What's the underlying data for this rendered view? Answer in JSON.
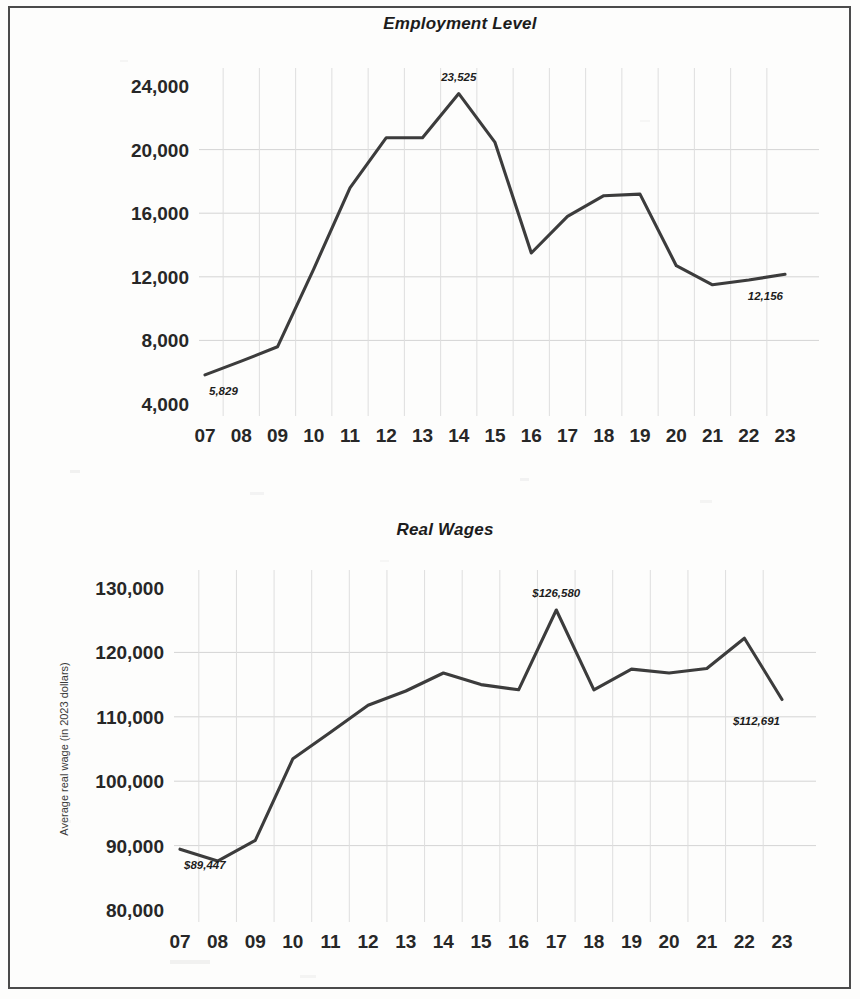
{
  "page": {
    "background_color": "#fdfdfc",
    "border_color": "#4b4b4b",
    "line_color": "#3c3c3c",
    "grid_color": "#d4d4d4"
  },
  "charts": {
    "employment": {
      "title": "Employment Level",
      "ylabel": "",
      "xlabel": "",
      "ylim": [
        4000,
        24000
      ],
      "ytick_step": 4000,
      "yticks": [
        "4,000",
        "8,000",
        "12,000",
        "16,000",
        "20,000",
        "24,000"
      ],
      "ytick_values": [
        4000,
        8000,
        12000,
        16000,
        20000,
        24000
      ],
      "xticks": [
        "07",
        "08",
        "09",
        "10",
        "11",
        "12",
        "13",
        "14",
        "15",
        "16",
        "17",
        "18",
        "19",
        "20",
        "21",
        "22",
        "23"
      ],
      "start_label": "5,829",
      "peak_label": "23,525",
      "end_label": "12,156"
    },
    "wages": {
      "title": "Real Wages",
      "ylabel": "Average real wage (in 2023 dollars)",
      "xlabel": "",
      "ylim": [
        80000,
        130000
      ],
      "ytick_step": 10000,
      "yticks": [
        "80,000",
        "90,000",
        "100,000",
        "110,000",
        "120,000",
        "130,000"
      ],
      "ytick_values": [
        80000,
        90000,
        100000,
        110000,
        120000,
        130000
      ],
      "xticks": [
        "07",
        "08",
        "09",
        "10",
        "11",
        "12",
        "13",
        "14",
        "15",
        "16",
        "17",
        "18",
        "19",
        "20",
        "21",
        "22",
        "23"
      ],
      "start_label": "$89,447",
      "peak_label": "$126,580",
      "end_label": "$112,691"
    }
  },
  "chart_data": [
    {
      "type": "line",
      "title": "Employment Level",
      "xlabel": "",
      "ylabel": "",
      "grid": true,
      "legend": "none",
      "ylim": [
        4000,
        24000
      ],
      "ytick_step": 4000,
      "x": [
        "07",
        "08",
        "09",
        "10",
        "11",
        "12",
        "13",
        "14",
        "15",
        "16",
        "17",
        "18",
        "19",
        "20",
        "21",
        "22",
        "23"
      ],
      "categories": [
        "07",
        "08",
        "09",
        "10",
        "11",
        "12",
        "13",
        "14",
        "15",
        "16",
        "17",
        "18",
        "19",
        "20",
        "21",
        "22",
        "23"
      ],
      "values": [
        5829,
        6700,
        7600,
        12500,
        17600,
        20750,
        20750,
        23525,
        20450,
        13500,
        15800,
        17100,
        17200,
        12700,
        11500,
        11800,
        12156
      ],
      "annotations": [
        {
          "x": "07",
          "text": "5,829",
          "value": 5829
        },
        {
          "x": "14",
          "text": "23,525",
          "value": 23525
        },
        {
          "x": "23",
          "text": "12,156",
          "value": 12156
        }
      ]
    },
    {
      "type": "line",
      "title": "Real Wages",
      "xlabel": "",
      "ylabel": "Average real wage (in 2023 dollars)",
      "grid": true,
      "legend": "none",
      "ylim": [
        80000,
        130000
      ],
      "ytick_step": 10000,
      "x": [
        "07",
        "08",
        "09",
        "10",
        "11",
        "12",
        "13",
        "14",
        "15",
        "16",
        "17",
        "18",
        "19",
        "20",
        "21",
        "22",
        "23"
      ],
      "categories": [
        "07",
        "08",
        "09",
        "10",
        "11",
        "12",
        "13",
        "14",
        "15",
        "16",
        "17",
        "18",
        "19",
        "20",
        "21",
        "22",
        "23"
      ],
      "values": [
        89447,
        87600,
        90800,
        103500,
        107600,
        111800,
        114000,
        116800,
        115000,
        114200,
        126580,
        114200,
        117400,
        116800,
        117500,
        122200,
        112691
      ],
      "annotations": [
        {
          "x": "07",
          "text": "$89,447",
          "value": 89447
        },
        {
          "x": "17",
          "text": "$126,580",
          "value": 126580
        },
        {
          "x": "23",
          "text": "$112,691",
          "value": 112691
        }
      ]
    }
  ]
}
